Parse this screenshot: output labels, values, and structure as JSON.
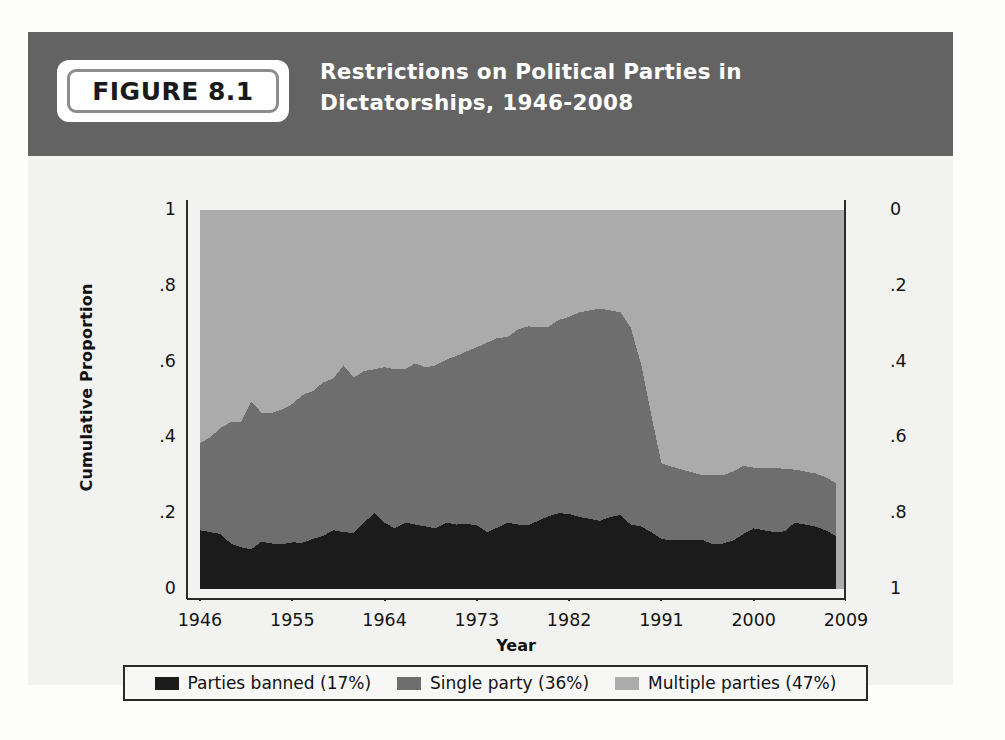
{
  "figure": {
    "badge_label": "FIGURE 8.1",
    "title": "Restrictions on Political Parties in Dictatorships, 1946-2008"
  },
  "colors": {
    "header_band": "#636363",
    "parties_banned": "#1b1b1b",
    "single_party": "#6e6e6e",
    "multiple_parties": "#ababab",
    "plot_background": "#ababab",
    "axis": "#2a2a2a",
    "text": "#141414",
    "panel_background": "#f2f2f0"
  },
  "legend": {
    "items": [
      {
        "label": "Parties banned (17%)",
        "color": "#1b1b1b",
        "swatch": "legend-swatch-parties-banned"
      },
      {
        "label": "Single party (36%)",
        "color": "#6e6e6e",
        "swatch": "legend-swatch-single-party"
      },
      {
        "label": "Multiple parties (47%)",
        "color": "#ababab",
        "swatch": "legend-swatch-multiple-parties"
      }
    ]
  },
  "chart_data": {
    "type": "area",
    "stacked": true,
    "title": "Restrictions on Political Parties in Dictatorships, 1946-2008",
    "xlabel": "Year",
    "ylabel": "Cumulative Proportion",
    "ylabel_right": "",
    "xlim": [
      1946,
      2009
    ],
    "ylim": [
      0,
      1
    ],
    "grid": false,
    "legend_position": "bottom",
    "xticks": [
      "1946",
      "1955",
      "1964",
      "1973",
      "1982",
      "1991",
      "2000",
      "2009"
    ],
    "xtick_values": [
      1946,
      1955,
      1964,
      1973,
      1982,
      1991,
      2000,
      2009
    ],
    "yticks_left": [
      "0",
      ".2",
      ".4",
      ".6",
      ".8",
      "1"
    ],
    "ytick_values_left": [
      0,
      0.2,
      0.4,
      0.6,
      0.8,
      1
    ],
    "yticks_right": [
      "0",
      ".2",
      ".4",
      ".6",
      ".8",
      "1"
    ],
    "ytick_values_right": [
      0,
      0.2,
      0.4,
      0.6,
      0.8,
      1
    ],
    "right_axis_inverted": true,
    "x": [
      1946,
      1947,
      1948,
      1949,
      1950,
      1951,
      1952,
      1953,
      1954,
      1955,
      1956,
      1957,
      1958,
      1959,
      1960,
      1961,
      1962,
      1963,
      1964,
      1965,
      1966,
      1967,
      1968,
      1969,
      1970,
      1971,
      1972,
      1973,
      1974,
      1975,
      1976,
      1977,
      1978,
      1979,
      1980,
      1981,
      1982,
      1983,
      1984,
      1985,
      1986,
      1987,
      1988,
      1989,
      1990,
      1991,
      1992,
      1993,
      1994,
      1995,
      1996,
      1997,
      1998,
      1999,
      2000,
      2001,
      2002,
      2003,
      2004,
      2005,
      2006,
      2007,
      2008
    ],
    "series": [
      {
        "name": "Parties banned (17%)",
        "color": "#1b1b1b",
        "values": [
          0.155,
          0.15,
          0.145,
          0.12,
          0.11,
          0.105,
          0.125,
          0.12,
          0.118,
          0.123,
          0.122,
          0.132,
          0.14,
          0.155,
          0.15,
          0.148,
          0.175,
          0.2,
          0.175,
          0.16,
          0.175,
          0.17,
          0.165,
          0.16,
          0.175,
          0.17,
          0.172,
          0.168,
          0.15,
          0.162,
          0.175,
          0.17,
          0.168,
          0.18,
          0.192,
          0.2,
          0.198,
          0.19,
          0.185,
          0.18,
          0.19,
          0.195,
          0.17,
          0.165,
          0.15,
          0.132,
          0.128,
          0.13,
          0.128,
          0.13,
          0.118,
          0.12,
          0.128,
          0.145,
          0.16,
          0.155,
          0.15,
          0.152,
          0.175,
          0.17,
          0.165,
          0.155,
          0.14
        ]
      },
      {
        "name": "Single party (36%)",
        "color": "#6e6e6e",
        "values": [
          0.23,
          0.25,
          0.28,
          0.32,
          0.33,
          0.39,
          0.34,
          0.345,
          0.355,
          0.365,
          0.39,
          0.39,
          0.405,
          0.4,
          0.44,
          0.41,
          0.4,
          0.38,
          0.41,
          0.42,
          0.405,
          0.425,
          0.42,
          0.43,
          0.43,
          0.445,
          0.455,
          0.47,
          0.5,
          0.5,
          0.49,
          0.515,
          0.525,
          0.51,
          0.5,
          0.51,
          0.52,
          0.54,
          0.55,
          0.56,
          0.545,
          0.535,
          0.52,
          0.43,
          0.31,
          0.2,
          0.195,
          0.185,
          0.18,
          0.17,
          0.182,
          0.18,
          0.182,
          0.18,
          0.16,
          0.165,
          0.17,
          0.165,
          0.14,
          0.14,
          0.14,
          0.14,
          0.14
        ]
      },
      {
        "name": "Multiple parties (47%)",
        "color": "#ababab",
        "values": [
          0.615,
          0.6,
          0.575,
          0.56,
          0.56,
          0.505,
          0.535,
          0.535,
          0.527,
          0.512,
          0.488,
          0.478,
          0.455,
          0.445,
          0.41,
          0.442,
          0.425,
          0.42,
          0.415,
          0.42,
          0.42,
          0.405,
          0.415,
          0.41,
          0.395,
          0.385,
          0.373,
          0.362,
          0.35,
          0.338,
          0.335,
          0.315,
          0.307,
          0.31,
          0.308,
          0.29,
          0.282,
          0.27,
          0.265,
          0.26,
          0.265,
          0.27,
          0.31,
          0.405,
          0.54,
          0.668,
          0.677,
          0.685,
          0.692,
          0.7,
          0.7,
          0.7,
          0.69,
          0.675,
          0.68,
          0.68,
          0.68,
          0.683,
          0.685,
          0.69,
          0.695,
          0.705,
          0.72
        ]
      }
    ]
  }
}
